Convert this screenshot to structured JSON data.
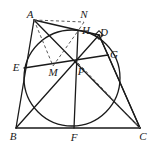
{
  "figure": {
    "kind": "geometry-diagram",
    "width": 162,
    "height": 147,
    "background": "#ffffff",
    "stroke_color": "#1a1a1a",
    "dash_color": "#5a5a5a"
  },
  "points": [
    {
      "id": "A",
      "label": "A",
      "x": 34,
      "y": 20,
      "label_x": 30,
      "label_y": 14
    },
    {
      "id": "N",
      "label": "N",
      "x": 84,
      "y": 22,
      "label_x": 84,
      "label_y": 14
    },
    {
      "id": "H",
      "label": "H",
      "x": 78,
      "y": 31,
      "label_x": 86,
      "label_y": 30
    },
    {
      "id": "D",
      "label": "D",
      "x": 99,
      "y": 35,
      "label_x": 104,
      "label_y": 32
    },
    {
      "id": "G",
      "label": "G",
      "x": 108,
      "y": 55,
      "label_x": 114,
      "label_y": 54
    },
    {
      "id": "E",
      "label": "E",
      "x": 24,
      "y": 68,
      "label_x": 16,
      "label_y": 67
    },
    {
      "id": "M",
      "label": "M",
      "x": 53,
      "y": 66,
      "label_x": 53,
      "label_y": 72
    },
    {
      "id": "P",
      "label": "P",
      "x": 78,
      "y": 63,
      "label_x": 81,
      "label_y": 71
    },
    {
      "id": "B",
      "label": "B",
      "x": 16,
      "y": 128,
      "label_x": 13,
      "label_y": 136
    },
    {
      "id": "F",
      "label": "F",
      "x": 74,
      "y": 128,
      "label_x": 74,
      "label_y": 137
    },
    {
      "id": "C",
      "label": "C",
      "x": 140,
      "y": 128,
      "label_x": 143,
      "label_y": 136
    }
  ],
  "circle": {
    "id": "incircle",
    "center_x": 72,
    "center_y": 78,
    "radius": 48,
    "stroke": "#1a1a1a",
    "stroke_width": 1.3
  },
  "solid_segments": [
    {
      "id": "AB",
      "from": "A",
      "to": "B"
    },
    {
      "id": "BC",
      "from": "B",
      "to": "C"
    },
    {
      "id": "CD",
      "from": "C",
      "to": "D"
    },
    {
      "id": "AD",
      "from": "A",
      "to": "D"
    },
    {
      "id": "AC",
      "from": "A",
      "to": "C"
    },
    {
      "id": "BD",
      "from": "B",
      "to": "D"
    },
    {
      "id": "EG",
      "from": "E",
      "to": "G"
    },
    {
      "id": "HF",
      "from": "H",
      "to": "F"
    },
    {
      "id": "CG",
      "from": "C",
      "to": "G"
    },
    {
      "id": "DG",
      "from": "D",
      "to": "G"
    }
  ],
  "dashed_segments": [
    {
      "id": "AN",
      "from": "A",
      "to": "N"
    },
    {
      "id": "NH",
      "from": "N",
      "to": "H"
    },
    {
      "id": "AM",
      "from": "A",
      "to": "M"
    },
    {
      "id": "MH",
      "from": "M",
      "to": "H"
    },
    {
      "id": "PC",
      "from": "P",
      "to": "C"
    }
  ],
  "right_angle_marks": [
    {
      "id": "mark-at-D",
      "x": 99,
      "y": 35,
      "size": 6
    }
  ]
}
